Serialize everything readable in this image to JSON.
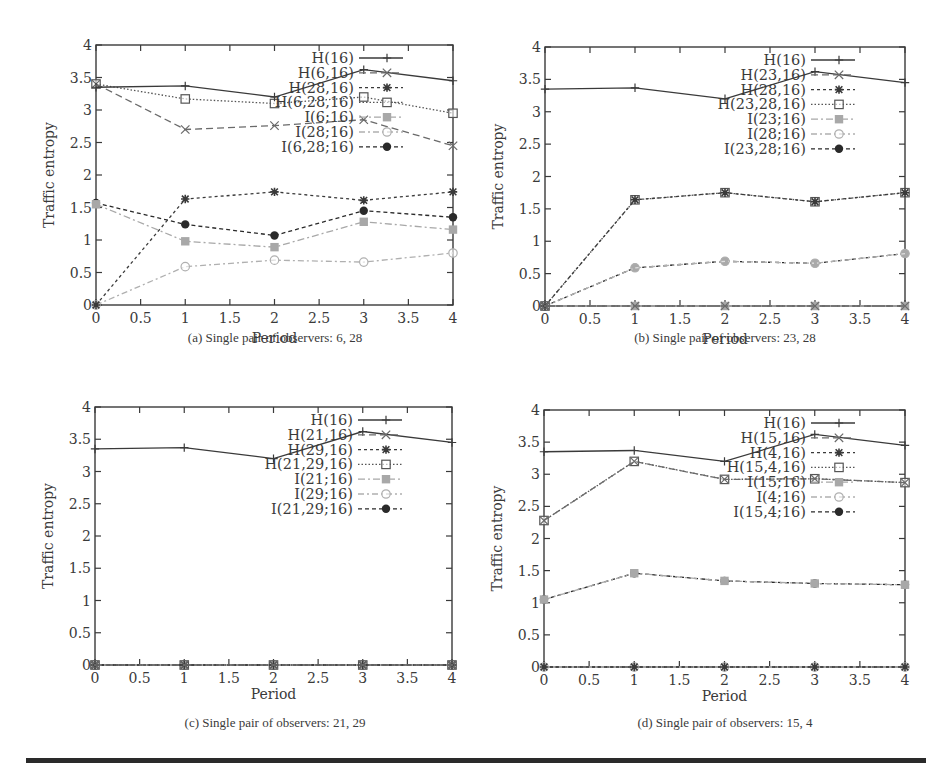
{
  "figure": {
    "bottom_rule": true,
    "colors": {
      "axis": "#3a3a3a",
      "dark_series": "#3a3a3a",
      "grey_series": "#9a9a9a",
      "light_series": "#b5b5b5"
    }
  },
  "chart_data": [
    {
      "id": "a",
      "type": "line",
      "title": "(a) Single pair of observers: 6, 28",
      "caption": "(a) Single pair of observers: 6, 28",
      "xlabel": "Period",
      "ylabel": "Traffic entropy",
      "x": [
        0,
        1,
        2,
        3,
        4
      ],
      "xlim": [
        0,
        4
      ],
      "ylim": [
        0,
        4
      ],
      "xticks": [
        "0",
        "0.5",
        "1",
        "1.5",
        "2",
        "2.5",
        "3",
        "3.5",
        "4"
      ],
      "yticks": [
        "0",
        "0.5",
        "1",
        "1.5",
        "2",
        "2.5",
        "3",
        "3.5",
        "4"
      ],
      "legend_position": "upper right",
      "series": [
        {
          "name": "H(16)",
          "values": [
            3.35,
            3.37,
            3.2,
            3.62,
            3.45
          ],
          "marker": "plus",
          "dash": "solid",
          "color": "#3a3a3a"
        },
        {
          "name": "H(6,16)",
          "values": [
            3.4,
            2.7,
            2.76,
            2.85,
            2.45
          ],
          "marker": "x",
          "dash": "dashed",
          "color": "#6a6a6a"
        },
        {
          "name": "H(28,16)",
          "values": [
            0,
            1.63,
            1.74,
            1.61,
            1.74
          ],
          "marker": "star",
          "dash": "dotted-short",
          "color": "#3a3a3a"
        },
        {
          "name": "H(6,28,16)",
          "values": [
            3.4,
            3.17,
            3.1,
            3.2,
            2.95
          ],
          "marker": "square-open",
          "dash": "dotted",
          "color": "#555555"
        },
        {
          "name": "I(6;16)",
          "values": [
            1.55,
            0.98,
            0.89,
            1.28,
            1.16
          ],
          "marker": "square-filled",
          "dash": "dashdot",
          "color": "#a8a8a8"
        },
        {
          "name": "I(28;16)",
          "values": [
            0,
            0.59,
            0.69,
            0.66,
            0.8
          ],
          "marker": "circle-open",
          "dash": "dashdot-light",
          "color": "#b0b0b0"
        },
        {
          "name": "I(6,28;16)",
          "values": [
            1.57,
            1.24,
            1.07,
            1.45,
            1.35
          ],
          "marker": "circle-filled",
          "dash": "dashed-short",
          "color": "#2a2a2a"
        }
      ]
    },
    {
      "id": "b",
      "type": "line",
      "title": "(b) Single pair of observers: 23, 28",
      "caption": "(b) Single pair of observers: 23, 28",
      "xlabel": "Period",
      "ylabel": "Traffic entropy",
      "x": [
        0,
        1,
        2,
        3,
        4
      ],
      "xlim": [
        0,
        4
      ],
      "ylim": [
        0,
        4
      ],
      "xticks": [
        "0",
        "0.5",
        "1",
        "1.5",
        "2",
        "2.5",
        "3",
        "3.5",
        "4"
      ],
      "yticks": [
        "0",
        "0.5",
        "1",
        "1.5",
        "2",
        "2.5",
        "3",
        "3.5",
        "4"
      ],
      "legend_position": "upper right",
      "series": [
        {
          "name": "H(16)",
          "values": [
            3.35,
            3.37,
            3.2,
            3.62,
            3.45
          ],
          "marker": "plus",
          "dash": "solid",
          "color": "#3a3a3a"
        },
        {
          "name": "H(23,16)",
          "values": [
            0,
            0,
            0,
            0,
            0
          ],
          "marker": "x",
          "dash": "dashed",
          "color": "#6a6a6a"
        },
        {
          "name": "H(28,16)",
          "values": [
            0,
            1.64,
            1.75,
            1.61,
            1.75
          ],
          "marker": "star",
          "dash": "dotted-short",
          "color": "#3a3a3a"
        },
        {
          "name": "H(23,28,16)",
          "values": [
            0,
            1.64,
            1.75,
            1.61,
            1.75
          ],
          "marker": "square-open",
          "dash": "dotted",
          "color": "#555555"
        },
        {
          "name": "I(23;16)",
          "values": [
            0,
            0,
            0,
            0,
            0
          ],
          "marker": "square-filled",
          "dash": "dashdot",
          "color": "#a8a8a8"
        },
        {
          "name": "I(28;16)",
          "values": [
            0,
            0.59,
            0.69,
            0.66,
            0.81
          ],
          "marker": "circle-open",
          "dash": "dashdot-light",
          "color": "#b0b0b0"
        },
        {
          "name": "I(23,28;16)",
          "values": [
            0,
            0.59,
            0.69,
            0.66,
            0.81
          ],
          "marker": "circle-filled",
          "dash": "dashed-short",
          "color": "#2a2a2a"
        }
      ]
    },
    {
      "id": "c",
      "type": "line",
      "title": "(c) Single pair of observers: 21, 29",
      "caption": "(c) Single pair of observers: 21, 29",
      "xlabel": "Period",
      "ylabel": "Traffic entropy",
      "x": [
        0,
        1,
        2,
        3,
        4
      ],
      "xlim": [
        0,
        4
      ],
      "ylim": [
        0,
        4
      ],
      "xticks": [
        "0",
        "0.5",
        "1",
        "1.5",
        "2",
        "2.5",
        "3",
        "3.5",
        "4"
      ],
      "yticks": [
        "0",
        "0.5",
        "1",
        "1.5",
        "2",
        "2.5",
        "3",
        "3.5",
        "4"
      ],
      "legend_position": "upper right",
      "series": [
        {
          "name": "H(16)",
          "values": [
            3.35,
            3.37,
            3.2,
            3.62,
            3.45
          ],
          "marker": "plus",
          "dash": "solid",
          "color": "#3a3a3a"
        },
        {
          "name": "H(21,16)",
          "values": [
            0,
            0,
            0,
            0,
            0
          ],
          "marker": "x",
          "dash": "dashed",
          "color": "#6a6a6a"
        },
        {
          "name": "H(29,16)",
          "values": [
            0,
            0,
            0,
            0,
            0
          ],
          "marker": "star",
          "dash": "dotted-short",
          "color": "#3a3a3a"
        },
        {
          "name": "H(21,29,16)",
          "values": [
            0,
            0,
            0,
            0,
            0
          ],
          "marker": "square-open",
          "dash": "dotted",
          "color": "#555555"
        },
        {
          "name": "I(21;16)",
          "values": [
            0,
            0,
            0,
            0,
            0
          ],
          "marker": "square-filled",
          "dash": "dashdot",
          "color": "#a8a8a8"
        },
        {
          "name": "I(29;16)",
          "values": [
            0,
            0,
            0,
            0,
            0
          ],
          "marker": "circle-open",
          "dash": "dashdot-light",
          "color": "#b0b0b0"
        },
        {
          "name": "I(21,29;16)",
          "values": [
            0,
            0,
            0,
            0,
            0
          ],
          "marker": "circle-filled",
          "dash": "dashed-short",
          "color": "#2a2a2a"
        }
      ]
    },
    {
      "id": "d",
      "type": "line",
      "title": "(d) Single pair of observers: 15, 4",
      "caption": "(d) Single pair of observers: 15, 4",
      "xlabel": "Period",
      "ylabel": "Traffic entropy",
      "x": [
        0,
        1,
        2,
        3,
        4
      ],
      "xlim": [
        0,
        4
      ],
      "ylim": [
        0,
        4
      ],
      "xticks": [
        "0",
        "0.5",
        "1",
        "1.5",
        "2",
        "2.5",
        "3",
        "3.5",
        "4"
      ],
      "yticks": [
        "0",
        "0.5",
        "1",
        "1.5",
        "2",
        "2.5",
        "3",
        "3.5",
        "4"
      ],
      "legend_position": "upper right",
      "series": [
        {
          "name": "H(16)",
          "values": [
            3.35,
            3.37,
            3.2,
            3.62,
            3.45
          ],
          "marker": "plus",
          "dash": "solid",
          "color": "#3a3a3a"
        },
        {
          "name": "H(15,16)",
          "values": [
            2.28,
            3.2,
            2.92,
            2.93,
            2.87
          ],
          "marker": "x",
          "dash": "dashed",
          "color": "#6a6a6a"
        },
        {
          "name": "H(4,16)",
          "values": [
            0,
            0,
            0,
            0,
            0
          ],
          "marker": "star",
          "dash": "dotted-short",
          "color": "#3a3a3a"
        },
        {
          "name": "H(15,4,16)",
          "values": [
            2.28,
            3.2,
            2.92,
            2.93,
            2.87
          ],
          "marker": "square-open",
          "dash": "dotted",
          "color": "#555555"
        },
        {
          "name": "I(15;16)",
          "values": [
            1.05,
            1.46,
            1.34,
            1.3,
            1.28
          ],
          "marker": "square-filled",
          "dash": "dashdot",
          "color": "#a8a8a8"
        },
        {
          "name": "I(4;16)",
          "values": [
            0,
            0,
            0,
            0,
            0
          ],
          "marker": "circle-open",
          "dash": "dashdot-light",
          "color": "#b0b0b0"
        },
        {
          "name": "I(15,4;16)",
          "values": [
            1.05,
            1.46,
            1.34,
            1.3,
            1.28
          ],
          "marker": "circle-filled",
          "dash": "dashed-short",
          "color": "#2a2a2a"
        }
      ]
    }
  ]
}
